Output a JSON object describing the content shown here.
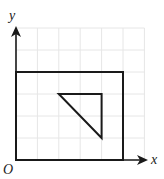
{
  "diagram": {
    "type": "coordinate-grid",
    "labels": {
      "x_axis": "x",
      "y_axis": "y",
      "origin": "O"
    },
    "grid": {
      "columns": 6,
      "rows": 6,
      "line_color": "#e6e6e6"
    },
    "shapes": {
      "rectangle": {
        "vertices": [
          [
            0,
            0
          ],
          [
            5,
            0
          ],
          [
            5,
            4
          ],
          [
            0,
            4
          ]
        ],
        "stroke": "#1a1a1a"
      },
      "triangle": {
        "vertices": [
          [
            2,
            3
          ],
          [
            4,
            3
          ],
          [
            4,
            1
          ]
        ],
        "stroke": "#1a1a1a"
      }
    },
    "axis_color": "#1a1a1a"
  }
}
